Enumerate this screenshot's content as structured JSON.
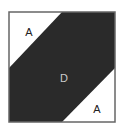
{
  "diagram": {
    "regions": [
      {
        "id": "top-left-triangle",
        "label": "A",
        "fill": "#ffffff"
      },
      {
        "id": "diagonal-band",
        "label": "D",
        "fill": "#2a2a2a"
      },
      {
        "id": "bottom-right-triangle",
        "label": "A",
        "fill": "#ffffff"
      }
    ],
    "colors": {
      "border": "#666666",
      "band": "#2a2a2a",
      "light": "#ffffff",
      "label_on_light": "#222222",
      "label_on_dark": "#cccccc"
    }
  }
}
